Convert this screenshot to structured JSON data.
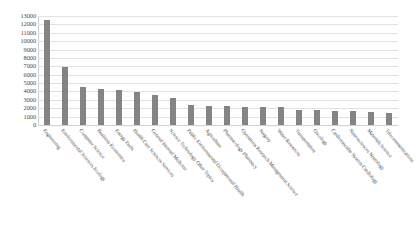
{
  "chart_data": {
    "type": "bar",
    "title": "",
    "xlabel": "",
    "ylabel": "",
    "ylim": [
      0,
      13000
    ],
    "ytick_step": 1000,
    "grid": true,
    "legend": "none",
    "bar_color": "#848484",
    "gridline_color": "#e2e2e2",
    "categories": [
      "Engineering",
      "Environmental Sciences Ecology",
      "Computer Science",
      "Business Economics",
      "Energy Fuels",
      "Health Care Sciences Services",
      "General Internal Medicine",
      "Science Technology Other Topics",
      "Public Environmental Occupational Health",
      "Agriculture",
      "Pharmacology Pharmacy",
      "Operations Research Management Science",
      "Surgery",
      "Water Resources",
      "Transportation",
      "Oncology",
      "Cardiovascular System Cardiology",
      "Neurosciences Neurology",
      "Materials Science",
      "Telecommunications"
    ],
    "values": [
      12500,
      6900,
      4500,
      4250,
      4150,
      3950,
      3550,
      3200,
      2400,
      2300,
      2250,
      2200,
      2150,
      2100,
      1800,
      1750,
      1700,
      1650,
      1500,
      1450
    ],
    "ytick_labels": [
      "13000",
      "12000",
      "11000",
      "10000",
      "9000",
      "8000",
      "7000",
      "6000",
      "5000",
      "4000",
      "3000",
      "2000",
      "1000",
      "0"
    ]
  }
}
